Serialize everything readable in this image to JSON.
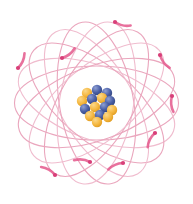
{
  "figure": {
    "background_color": "#ffffff",
    "width": 193,
    "height": 204,
    "center": {
      "x": 96.5,
      "y": 103
    }
  },
  "palette": {
    "orbit_stroke": "#eaa6bd",
    "orbit_stroke_light": "#f0bcce",
    "electron_trail": "#e4588c",
    "electron_dot": "#d83f79",
    "proton_fill": "#f5b841",
    "proton_highlight": "#fbd88a",
    "neutron_fill": "#4a5fa5",
    "neutron_highlight": "#8fa0d4",
    "background": "#ffffff"
  },
  "orbits": {
    "label": "electron orbital ellipses",
    "count": 9,
    "rx": 82,
    "ry": 37,
    "stroke_width": 1.1,
    "rotations_deg": [
      0,
      20,
      40,
      60,
      80,
      100,
      120,
      140,
      160
    ]
  },
  "electrons": {
    "label": "electrons travelling on orbits",
    "count": 9,
    "dot_radius": 2.1,
    "trail_width": 2.6,
    "positions": [
      {
        "id": "electron-1",
        "x": 115,
        "y": 22
      },
      {
        "id": "electron-2",
        "x": 160,
        "y": 55
      },
      {
        "id": "electron-3",
        "x": 172,
        "y": 96
      },
      {
        "id": "electron-4",
        "x": 155,
        "y": 133
      },
      {
        "id": "electron-5",
        "x": 123,
        "y": 163
      },
      {
        "id": "electron-6",
        "x": 90,
        "y": 162
      },
      {
        "id": "electron-7",
        "x": 55,
        "y": 175
      },
      {
        "id": "electron-8",
        "x": 18,
        "y": 68
      },
      {
        "id": "electron-9",
        "x": 62,
        "y": 58
      }
    ]
  },
  "nucleus": {
    "label": "nucleus",
    "center": {
      "x": 97,
      "y": 103
    },
    "radius": 18,
    "nucleon_radius": 5.2,
    "nucleons": [
      {
        "type": "proton",
        "x": 87,
        "y": 93
      },
      {
        "type": "neutron",
        "x": 97,
        "y": 90
      },
      {
        "type": "neutron",
        "x": 107,
        "y": 93
      },
      {
        "type": "proton",
        "x": 82,
        "y": 101
      },
      {
        "type": "neutron",
        "x": 92,
        "y": 99
      },
      {
        "type": "proton",
        "x": 102,
        "y": 98
      },
      {
        "type": "neutron",
        "x": 110,
        "y": 101
      },
      {
        "type": "neutron",
        "x": 85,
        "y": 109
      },
      {
        "type": "proton",
        "x": 95,
        "y": 107
      },
      {
        "type": "neutron",
        "x": 105,
        "y": 107
      },
      {
        "type": "proton",
        "x": 112,
        "y": 110
      },
      {
        "type": "proton",
        "x": 90,
        "y": 116
      },
      {
        "type": "neutron",
        "x": 100,
        "y": 115
      },
      {
        "type": "proton",
        "x": 108,
        "y": 117
      },
      {
        "type": "proton",
        "x": 97,
        "y": 122
      }
    ]
  }
}
